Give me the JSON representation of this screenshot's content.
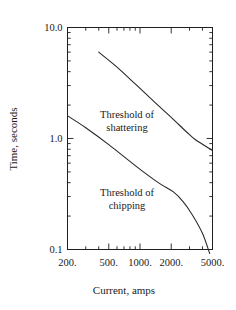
{
  "chart_data": {
    "type": "line",
    "title": "",
    "xlabel": "Current, amps",
    "ylabel": "Time, seconds",
    "xscale": "log",
    "yscale": "log",
    "xlim": [
      200,
      5000
    ],
    "ylim": [
      0.1,
      10.0
    ],
    "grid": false,
    "legend": "none",
    "xticklabels": [
      "200.",
      "500.",
      "1000.",
      "2000.",
      "5000."
    ],
    "xtickvalues": [
      200,
      500,
      1000,
      2000,
      5000
    ],
    "yticklabels": [
      "10.0",
      "1.0",
      "0.1"
    ],
    "ytickvalues": [
      10.0,
      1.0,
      0.1
    ],
    "annotations": [
      {
        "name": "shattering",
        "line1": "Threshold of",
        "line2": "shattering"
      },
      {
        "name": "chipping",
        "line1": "Threshold of",
        "line2": "chipping"
      }
    ],
    "series": [
      {
        "name": "Threshold of shattering",
        "x": [
          400,
          600,
          900,
          1400,
          2000,
          2800,
          3400,
          5000
        ],
        "y": [
          6.0,
          4.4,
          3.1,
          2.1,
          1.55,
          1.15,
          0.98,
          0.78
        ]
      },
      {
        "name": "Threshold of chipping",
        "x": [
          200,
          300,
          500,
          900,
          1500,
          2100,
          2600,
          3200,
          4000,
          4700
        ],
        "y": [
          1.6,
          1.25,
          0.88,
          0.57,
          0.4,
          0.33,
          0.27,
          0.205,
          0.14,
          0.092
        ]
      }
    ]
  },
  "colors": {
    "background": "#ffffff",
    "axis": "#1f1f1f",
    "curve": "#262626",
    "text": "#1a1a1a"
  }
}
